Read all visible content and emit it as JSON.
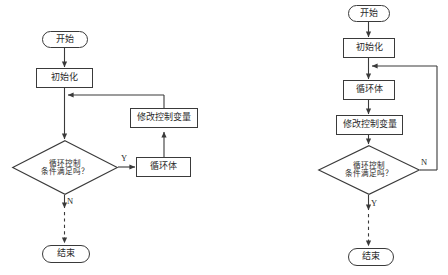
{
  "figure": {
    "type": "flowchart-pair",
    "background": "#ffffff",
    "line_color": "#3a3a3a",
    "text_color": "#2b2b2b"
  },
  "left_chart": {
    "name": "pre-test-loop-flowchart",
    "nodes": {
      "start": "开始",
      "init": "初始化",
      "update": "修改控制变量",
      "decision": "循环控制\n条件满足吗？",
      "body": "循环体",
      "end": "结束"
    },
    "branch_yes": "Y",
    "branch_no": "N"
  },
  "right_chart": {
    "name": "post-test-loop-flowchart",
    "nodes": {
      "start": "开始",
      "init": "初始化",
      "body": "循环体",
      "update": "修改控制变量",
      "decision": "循环控制\n条件满足吗？",
      "end": "结束"
    },
    "branch_yes": "Y",
    "branch_no": "N"
  }
}
